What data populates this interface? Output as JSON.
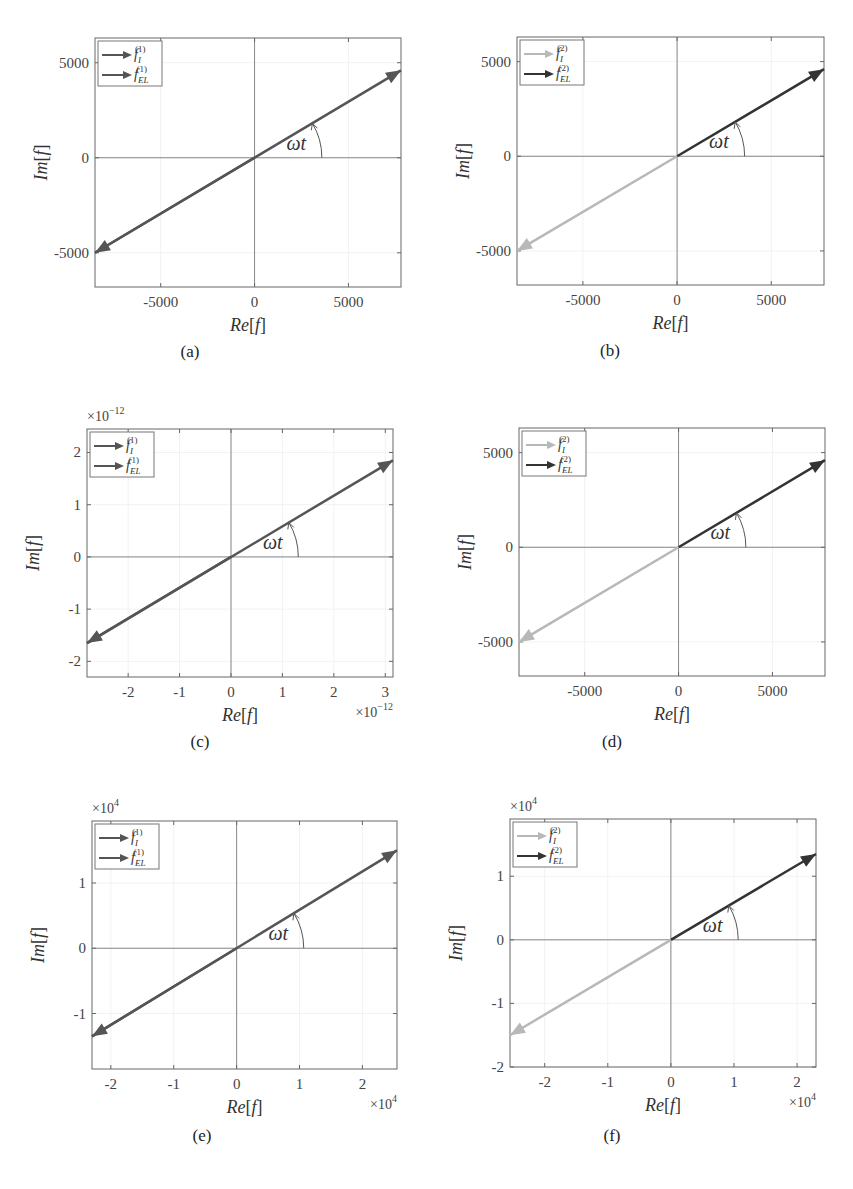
{
  "chart_data": [
    {
      "id": "a",
      "caption": "(a)",
      "type": "vector",
      "xlabel": "Re[f]",
      "ylabel": "Im[f]",
      "x_multiplier": "",
      "y_multiplier": "",
      "xlim": [
        -8500,
        7800
      ],
      "ylim": [
        -6800,
        6300
      ],
      "xticks": [
        -5000,
        0,
        5000
      ],
      "xtick_labels": [
        "-5000",
        "0",
        "5000"
      ],
      "yticks": [
        -5000,
        0,
        5000
      ],
      "ytick_labels": [
        "-5000",
        "0",
        "5000"
      ],
      "legend": [
        {
          "label": "f_I^(1)",
          "color": "#555555"
        },
        {
          "label": "f_EL^(1)",
          "color": "#555555"
        }
      ],
      "series": [
        {
          "name": "f_I^(1)",
          "from": [
            0,
            0
          ],
          "to": [
            -8500,
            -5000
          ],
          "color": "#555555"
        },
        {
          "name": "f_EL^(1)",
          "from": [
            -8500,
            -5000
          ],
          "to": [
            7800,
            4600
          ],
          "color": "#555555"
        }
      ],
      "annotation": "ωt"
    },
    {
      "id": "b",
      "caption": "(b)",
      "type": "vector",
      "xlabel": "Re[f]",
      "ylabel": "Im[f]",
      "x_multiplier": "",
      "y_multiplier": "",
      "xlim": [
        -8500,
        7800
      ],
      "ylim": [
        -6800,
        6300
      ],
      "xticks": [
        -5000,
        0,
        5000
      ],
      "xtick_labels": [
        "-5000",
        "0",
        "5000"
      ],
      "yticks": [
        -5000,
        0,
        5000
      ],
      "ytick_labels": [
        "-5000",
        "0",
        "5000"
      ],
      "legend": [
        {
          "label": "f_I^(2)",
          "color": "#b8b8b8"
        },
        {
          "label": "f_EL^(2)",
          "color": "#333333"
        }
      ],
      "series": [
        {
          "name": "f_I^(2)",
          "from": [
            0,
            0
          ],
          "to": [
            -8500,
            -5000
          ],
          "color": "#b8b8b8"
        },
        {
          "name": "f_EL^(2)",
          "from": [
            0,
            0
          ],
          "to": [
            7800,
            4600
          ],
          "color": "#333333"
        }
      ],
      "annotation": "ωt"
    },
    {
      "id": "c",
      "caption": "(c)",
      "type": "vector",
      "xlabel": "Re[f]",
      "ylabel": "Im[f]",
      "x_multiplier": "×10^-12",
      "y_multiplier": "×10^-12",
      "xlim": [
        -2.8,
        3.15
      ],
      "ylim": [
        -2.3,
        2.45
      ],
      "xticks": [
        -2,
        -1,
        0,
        1,
        2,
        3
      ],
      "xtick_labels": [
        "-2",
        "-1",
        "0",
        "1",
        "2",
        "3"
      ],
      "yticks": [
        -2,
        -1,
        0,
        1,
        2
      ],
      "ytick_labels": [
        "-2",
        "-1",
        "0",
        "1",
        "2"
      ],
      "legend": [
        {
          "label": "f_I^(1)",
          "color": "#555555"
        },
        {
          "label": "f_EL^(1)",
          "color": "#555555"
        }
      ],
      "series": [
        {
          "name": "f_I^(1)",
          "from": [
            0,
            0
          ],
          "to": [
            -2.8,
            -1.65
          ],
          "color": "#555555"
        },
        {
          "name": "f_EL^(1)",
          "from": [
            -2.8,
            -1.65
          ],
          "to": [
            3.15,
            1.85
          ],
          "color": "#555555"
        }
      ],
      "annotation": "ωt"
    },
    {
      "id": "d",
      "caption": "(d)",
      "type": "vector",
      "xlabel": "Re[f]",
      "ylabel": "Im[f]",
      "x_multiplier": "",
      "y_multiplier": "",
      "xlim": [
        -8500,
        7800
      ],
      "ylim": [
        -6800,
        6300
      ],
      "xticks": [
        -5000,
        0,
        5000
      ],
      "xtick_labels": [
        "-5000",
        "0",
        "5000"
      ],
      "yticks": [
        -5000,
        0,
        5000
      ],
      "ytick_labels": [
        "-5000",
        "0",
        "5000"
      ],
      "legend": [
        {
          "label": "f_I^(2)",
          "color": "#b8b8b8"
        },
        {
          "label": "f_EL^(2)",
          "color": "#333333"
        }
      ],
      "series": [
        {
          "name": "f_I^(2)",
          "from": [
            0,
            0
          ],
          "to": [
            -8500,
            -5000
          ],
          "color": "#b8b8b8"
        },
        {
          "name": "f_EL^(2)",
          "from": [
            0,
            0
          ],
          "to": [
            7800,
            4600
          ],
          "color": "#333333"
        }
      ],
      "annotation": "ωt"
    },
    {
      "id": "e",
      "caption": "(e)",
      "type": "vector",
      "xlabel": "Re[f]",
      "ylabel": "Im[f]",
      "x_multiplier": "×10^4",
      "y_multiplier": "×10^4",
      "xlim": [
        -2.3,
        2.55
      ],
      "ylim": [
        -1.85,
        1.95
      ],
      "xticks": [
        -2,
        -1,
        0,
        1,
        2
      ],
      "xtick_labels": [
        "-2",
        "-1",
        "0",
        "1",
        "2"
      ],
      "yticks": [
        -1,
        0,
        1
      ],
      "ytick_labels": [
        "-1",
        "0",
        "1"
      ],
      "legend": [
        {
          "label": "f_I^(1)",
          "color": "#555555"
        },
        {
          "label": "f_EL^(1)",
          "color": "#555555"
        }
      ],
      "series": [
        {
          "name": "f_I^(1)",
          "from": [
            0,
            0
          ],
          "to": [
            -2.3,
            -1.35
          ],
          "color": "#555555"
        },
        {
          "name": "f_EL^(1)",
          "from": [
            -2.3,
            -1.35
          ],
          "to": [
            2.55,
            1.5
          ],
          "color": "#555555"
        }
      ],
      "annotation": "ωt"
    },
    {
      "id": "f",
      "caption": "(f)",
      "type": "vector",
      "xlabel": "Re[f]",
      "ylabel": "Im[f]",
      "x_multiplier": "×10^4",
      "y_multiplier": "×10^4",
      "xlim": [
        -2.55,
        2.3
      ],
      "ylim": [
        -2.0,
        1.9
      ],
      "xticks": [
        -2,
        -1,
        0,
        1,
        2
      ],
      "xtick_labels": [
        "-2",
        "-1",
        "0",
        "1",
        "2"
      ],
      "yticks": [
        -2,
        -1,
        0,
        1
      ],
      "ytick_labels": [
        "-2",
        "-1",
        "0",
        "1"
      ],
      "legend": [
        {
          "label": "f_I^(2)",
          "color": "#b8b8b8"
        },
        {
          "label": "f_EL^(2)",
          "color": "#333333"
        }
      ],
      "series": [
        {
          "name": "f_I^(2)",
          "from": [
            0,
            0
          ],
          "to": [
            -2.55,
            -1.5
          ],
          "color": "#b8b8b8"
        },
        {
          "name": "f_EL^(2)",
          "from": [
            0,
            0
          ],
          "to": [
            2.3,
            1.35
          ],
          "color": "#333333"
        }
      ],
      "annotation": "ωt"
    }
  ],
  "layout": {
    "frames": [
      {
        "left": 95,
        "top": 38,
        "width": 306,
        "height": 249,
        "cap_x": 190,
        "cap_y": 358
      },
      {
        "left": 517,
        "top": 37,
        "width": 307,
        "height": 248,
        "cap_x": 610,
        "cap_y": 357
      },
      {
        "left": 87,
        "top": 429,
        "width": 306,
        "height": 248,
        "cap_x": 200,
        "cap_y": 748
      },
      {
        "left": 519,
        "top": 428,
        "width": 306,
        "height": 248,
        "cap_x": 612,
        "cap_y": 748
      },
      {
        "left": 92,
        "top": 821,
        "width": 305,
        "height": 248,
        "cap_x": 202,
        "cap_y": 1142
      },
      {
        "left": 510,
        "top": 819,
        "width": 306,
        "height": 248,
        "cap_x": 612,
        "cap_y": 1142
      }
    ]
  }
}
